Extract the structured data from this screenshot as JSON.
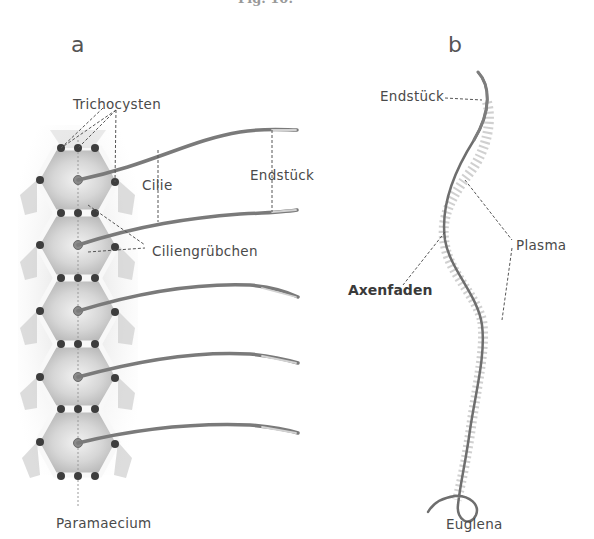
{
  "figure": {
    "caption": "Fig. 10.",
    "panels": [
      {
        "letter": "a",
        "organism": "Paramaecium",
        "labels": {
          "trichocysten": "Trichocysten",
          "cilie": "Cilie",
          "endstueck": "Endstück",
          "ciliengruebchen": "Ciliengrübchen"
        }
      },
      {
        "letter": "b",
        "organism": "Euglena",
        "labels": {
          "endstueck": "Endstück",
          "plasma": "Plasma",
          "axenfaden": "Axenfaden"
        }
      }
    ]
  }
}
